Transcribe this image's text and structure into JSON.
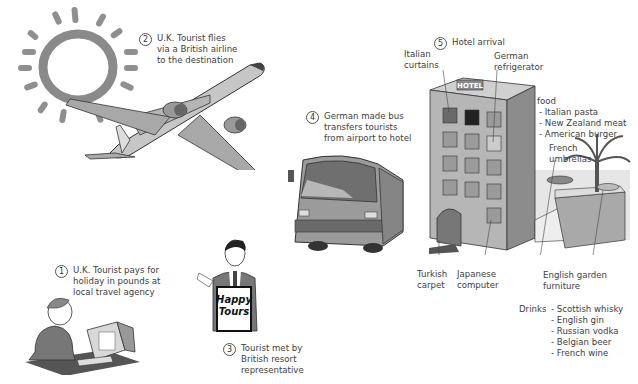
{
  "steps": [
    {
      "number": "1",
      "lines": [
        "U.K. Tourist pays for",
        "holiday in pounds at",
        "local travel agency"
      ]
    },
    {
      "number": "2",
      "lines": [
        "U.K. Tourist flies",
        "via a British airline",
        "to the destination"
      ]
    },
    {
      "number": "3",
      "lines": [
        "Tourist met by",
        "British resort",
        "representative"
      ]
    },
    {
      "number": "4",
      "lines": [
        "German made bus",
        "transfers tourists",
        "from airport to hotel"
      ]
    },
    {
      "number": "5",
      "lines": [
        "Hotel arrival"
      ]
    }
  ],
  "hotel_labels": {
    "curtains": [
      "Italian",
      "curtains"
    ],
    "refrigerator": [
      "German",
      "refrigerator"
    ],
    "carpet": [
      "Turkish",
      "carpet"
    ],
    "computer": [
      "Japanese",
      "computer"
    ],
    "umbrellas": [
      "French",
      "umbrellas"
    ],
    "furniture": [
      "English garden",
      "furniture"
    ],
    "hotel_sign": "HOTEL"
  },
  "food": {
    "title": "food",
    "items": [
      "- Italian pasta",
      "- New Zealand meat",
      "- American burger"
    ]
  },
  "drinks": {
    "title": "Drinks",
    "items": [
      "- Scottish whisky",
      "- English gin",
      "- Russian vodka",
      "- Belgian beer",
      "- French wine"
    ]
  },
  "sign": {
    "line1": "Happy",
    "line2": "Tours"
  },
  "colors": {
    "ink": "#404040",
    "grey_fill": "#9a9a9a",
    "light_fill": "#cfcfcf",
    "sun": "#8c8c8c"
  }
}
